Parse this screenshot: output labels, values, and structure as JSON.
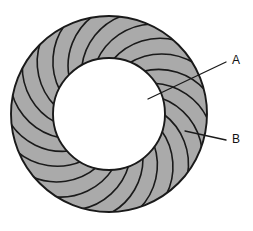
{
  "figure": {
    "background_color": "#ffffff",
    "vane_fill_color": "#aaaaaa",
    "hub_fill_color": "#ffffff",
    "outline_color": "#1a1a1a",
    "geometry": {
      "center_x": 109,
      "center_y": 114,
      "outer_radius": 98,
      "inner_radius": 56,
      "vane_count": 21,
      "vane_sweep_degrees": 38
    },
    "callouts": [
      {
        "id": "callout-a",
        "label": "A",
        "label_x": 232,
        "label_y": 61,
        "leader_start_x": 226,
        "leader_start_y": 62,
        "leader_end_x": 148,
        "leader_end_y": 99,
        "target": "inner-hub"
      },
      {
        "id": "callout-b",
        "label": "B",
        "label_x": 232,
        "label_y": 140,
        "leader_start_x": 226,
        "leader_start_y": 140,
        "leader_end_x": 185,
        "leader_end_y": 131,
        "target": "outer-vane-ring"
      }
    ]
  }
}
